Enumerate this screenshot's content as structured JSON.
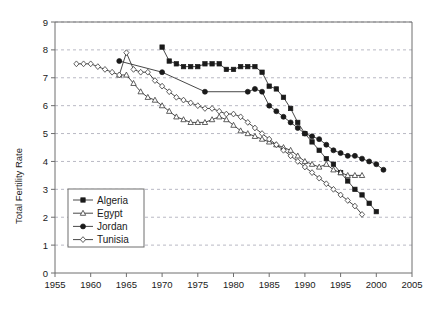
{
  "chart_data": {
    "type": "line",
    "title": "",
    "xlabel": "",
    "ylabel": "Total Fertility Rate",
    "xlim": [
      1955,
      2005
    ],
    "ylim": [
      0,
      9
    ],
    "xticks": [
      1955,
      1960,
      1965,
      1970,
      1975,
      1980,
      1985,
      1990,
      1995,
      2000,
      2005
    ],
    "yticks": [
      0,
      1,
      2,
      3,
      4,
      5,
      6,
      7,
      8,
      9
    ],
    "grid": "horizontal-dashed",
    "legend_position": "lower-left-inside",
    "series": [
      {
        "name": "Algeria",
        "marker": "filled-square",
        "x": [
          1970,
          1971,
          1972,
          1973,
          1974,
          1975,
          1976,
          1977,
          1978,
          1979,
          1980,
          1981,
          1982,
          1983,
          1984,
          1985,
          1986,
          1987,
          1988,
          1989,
          1990,
          1991,
          1992,
          1993,
          1994,
          1995,
          1996,
          1997,
          1998,
          1999,
          2000
        ],
        "values": [
          8.1,
          7.6,
          7.5,
          7.4,
          7.4,
          7.4,
          7.5,
          7.5,
          7.5,
          7.3,
          7.3,
          7.4,
          7.4,
          7.4,
          7.2,
          6.7,
          6.6,
          6.3,
          5.9,
          5.4,
          5.0,
          4.7,
          4.4,
          4.1,
          3.9,
          3.6,
          3.3,
          3.0,
          2.8,
          2.5,
          2.2
        ]
      },
      {
        "name": "Egypt",
        "marker": "open-triangle",
        "x": [
          1964,
          1965,
          1966,
          1967,
          1968,
          1969,
          1970,
          1971,
          1972,
          1973,
          1974,
          1975,
          1976,
          1977,
          1978,
          1979,
          1980,
          1981,
          1982,
          1983,
          1984,
          1985,
          1986,
          1987,
          1988,
          1989,
          1990,
          1991,
          1992,
          1993,
          1994,
          1995,
          1996,
          1997,
          1998
        ],
        "values": [
          7.1,
          7.1,
          6.8,
          6.5,
          6.3,
          6.2,
          6.0,
          5.8,
          5.6,
          5.5,
          5.4,
          5.4,
          5.4,
          5.5,
          5.6,
          5.5,
          5.3,
          5.1,
          5.0,
          4.9,
          4.8,
          4.7,
          4.6,
          4.5,
          4.4,
          4.2,
          4.0,
          3.9,
          3.8,
          3.9,
          3.7,
          3.6,
          3.5,
          3.5,
          3.5
        ]
      },
      {
        "name": "Jordan",
        "marker": "filled-circle",
        "x": [
          1964,
          1970,
          1976,
          1982,
          1983,
          1984,
          1985,
          1986,
          1987,
          1988,
          1989,
          1990,
          1991,
          1992,
          1993,
          1994,
          1995,
          1996,
          1997,
          1998,
          1999,
          2000,
          2001
        ],
        "values": [
          7.6,
          7.2,
          6.5,
          6.5,
          6.6,
          6.5,
          6.0,
          5.8,
          5.6,
          5.4,
          5.2,
          5.0,
          4.9,
          4.8,
          4.6,
          4.4,
          4.3,
          4.2,
          4.2,
          4.1,
          4.0,
          3.9,
          3.7
        ]
      },
      {
        "name": "Tunisia",
        "marker": "open-diamond",
        "x": [
          1958,
          1959,
          1960,
          1961,
          1962,
          1963,
          1964,
          1965,
          1966,
          1967,
          1968,
          1969,
          1970,
          1971,
          1972,
          1973,
          1974,
          1975,
          1976,
          1977,
          1978,
          1979,
          1980,
          1981,
          1982,
          1983,
          1984,
          1985,
          1986,
          1987,
          1988,
          1989,
          1990,
          1991,
          1992,
          1993,
          1994,
          1995,
          1996,
          1997,
          1998
        ],
        "values": [
          7.5,
          7.5,
          7.5,
          7.4,
          7.3,
          7.2,
          7.1,
          7.9,
          7.3,
          7.2,
          7.2,
          6.9,
          6.7,
          6.5,
          6.3,
          6.2,
          6.1,
          6.0,
          5.9,
          5.9,
          5.8,
          5.7,
          5.7,
          5.6,
          5.4,
          5.2,
          5.0,
          4.8,
          4.6,
          4.4,
          4.2,
          4.0,
          3.8,
          3.6,
          3.4,
          3.2,
          3.0,
          2.8,
          2.6,
          2.4,
          2.1
        ]
      }
    ]
  },
  "axis": {
    "ylabel": "Total Fertility Rate"
  },
  "legend": {
    "items": [
      {
        "label": "Algeria"
      },
      {
        "label": "Egypt"
      },
      {
        "label": "Jordan"
      },
      {
        "label": "Tunisia"
      }
    ]
  }
}
